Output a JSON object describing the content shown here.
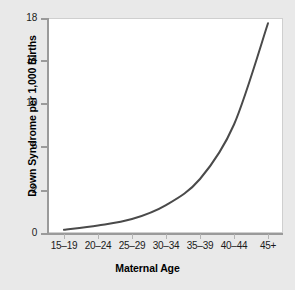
{
  "chart_data": {
    "type": "line",
    "title": "",
    "subtitle": "",
    "xlabel": "Maternal Age",
    "ylabel": "Down Syndrome per 1,000 Births",
    "categories": [
      "15–19",
      "20–24",
      "25–29",
      "30–34",
      "35–39",
      "40–44",
      "45+"
    ],
    "values": [
      0.15,
      0.35,
      0.65,
      1.3,
      3.0,
      8.0,
      17.5
    ],
    "series": [
      {
        "name": "Down Syndrome rate",
        "values": [
          0.15,
          0.35,
          0.65,
          1.3,
          3.0,
          8.0,
          17.5
        ]
      }
    ],
    "y_ticks": [
      0,
      2,
      6,
      10,
      14,
      18
    ],
    "y_tick_labels": [
      "0",
      "2",
      "6",
      "10",
      "14",
      "18"
    ],
    "ylim": [
      0,
      18
    ],
    "y_scale": "nonlinear-compressed",
    "x_tick_labels": [
      "15–19",
      "20–24",
      "25–29",
      "30–34",
      "35–39",
      "40–44",
      "45+"
    ],
    "grid": false,
    "legend": false,
    "legend_position": "none",
    "line_color": "#4a4a4a",
    "line_width": 2,
    "plot_background": "#ffffff",
    "figure_background": "#e9e9e9",
    "axis_color": "#9a9a9a",
    "text_color": "#1b1b1b",
    "annotations": []
  }
}
